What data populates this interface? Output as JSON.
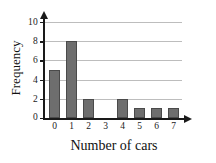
{
  "chart_data": {
    "type": "bar",
    "title": "",
    "subtitle": "",
    "xlabel": "Number of cars",
    "ylabel": "Frequency",
    "categories": [
      "0",
      "1",
      "2",
      "3",
      "4",
      "5",
      "6",
      "7"
    ],
    "values": [
      5,
      8,
      2,
      0,
      2,
      1,
      1,
      1
    ],
    "series": [
      {
        "name": "Frequency",
        "values": [
          5,
          8,
          2,
          0,
          2,
          1,
          1,
          1
        ]
      }
    ],
    "ylim": [
      0,
      10
    ],
    "xlim": [
      0,
      7
    ],
    "y_ticks": [
      "0",
      "2",
      "4",
      "6",
      "8",
      "10"
    ],
    "y_tick_values": [
      0,
      2,
      4,
      6,
      8,
      10
    ],
    "x_ticks": [
      "0",
      "1",
      "2",
      "3",
      "4",
      "5",
      "6",
      "7"
    ],
    "grid": "horizontal",
    "legend": "none",
    "colors": {
      "bar_fill": "#6e6e6e",
      "bar_stroke": "#4a4a4a",
      "gridline": "#bdbdbd",
      "axis": "#1a1a1a",
      "text": "#111111",
      "background": "#ffffff"
    }
  }
}
